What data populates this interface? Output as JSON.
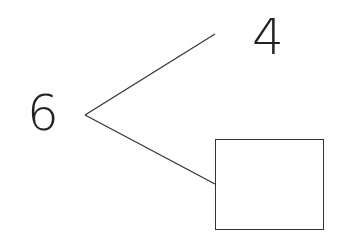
{
  "diagram": {
    "type": "number-bond",
    "whole": "6",
    "parts": [
      "4",
      ""
    ],
    "unknown_part": "box"
  },
  "colors": {
    "line": "#333333",
    "text": "#222222",
    "background": "#ffffff"
  }
}
